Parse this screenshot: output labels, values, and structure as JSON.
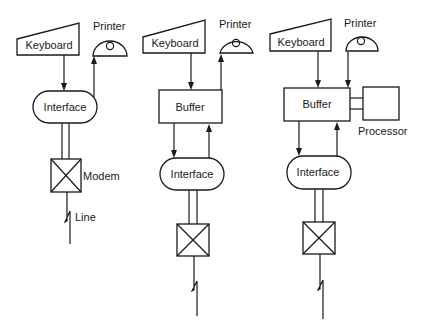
{
  "diagram": {
    "type": "terminal-configuration-block-diagram",
    "panels": [
      {
        "id": "panel-1",
        "keyboard": "Keyboard",
        "printer": "Printer",
        "interface": "Interface",
        "modem": "Modem",
        "line": "Line"
      },
      {
        "id": "panel-2",
        "keyboard": "Keyboard",
        "printer": "Printer",
        "buffer": "Buffer",
        "interface": "Interface"
      },
      {
        "id": "panel-3",
        "keyboard": "Keyboard",
        "printer": "Printer",
        "buffer": "Buffer",
        "processor": "Processor",
        "interface": "Interface"
      }
    ],
    "colors": {
      "stroke": "#1a1a1a",
      "background": "#ffffff"
    }
  }
}
